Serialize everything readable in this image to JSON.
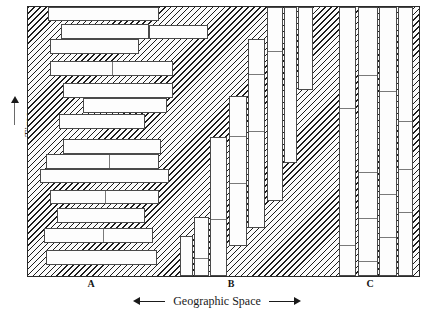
{
  "figure": {
    "type": "time-geography-settlement-diagram",
    "background_fill": "diagonal-hatch",
    "hatch_color": "#1d1d1d",
    "block_fill": "#fdfdfd",
    "block_stroke": "#4a4a4a",
    "frame_stroke": "#2a2a2a"
  },
  "axes": {
    "y": {
      "label": "Time",
      "arrow": "up",
      "direction_hint": "increasing upward"
    },
    "x": {
      "caption": "Geographic Space",
      "arrow_left": "◀",
      "arrow_right": "▶",
      "tick_labels": [
        "A",
        "B",
        "C"
      ]
    }
  },
  "regions": [
    {
      "id": "A",
      "label": "A",
      "label_x_pct": 16.2,
      "orientation": "horizontal-bars",
      "bar_count": 14
    },
    {
      "id": "B",
      "label": "B",
      "label_x_pct": 52.0,
      "orientation": "vertical-bars-ascending",
      "bar_count": 8
    },
    {
      "id": "C",
      "label": "C",
      "label_x_pct": 85.0,
      "orientation": "vertical-bars-tall",
      "bar_count": 4
    }
  ],
  "chart_data": {
    "type": "bar",
    "title": "",
    "xlabel": "Geographic Space",
    "ylabel": "Time",
    "xlim": [
      0,
      100
    ],
    "ylim": [
      0,
      100
    ],
    "grid": false,
    "legend": "none",
    "categories": [
      "A",
      "B",
      "C"
    ],
    "values": [
      14,
      8,
      4
    ],
    "blocks_A": [
      {
        "x": 5.0,
        "y": 0.0,
        "w": 28.5,
        "h": 5.2,
        "splits": []
      },
      {
        "x": 8.5,
        "y": 6.2,
        "w": 22.5,
        "h": 5.6,
        "splits": []
      },
      {
        "x": 31.0,
        "y": 6.8,
        "w": 15.0,
        "h": 5.0,
        "splits": []
      },
      {
        "x": 5.5,
        "y": 12.0,
        "w": 23.0,
        "h": 5.4,
        "splits": []
      },
      {
        "x": 5.5,
        "y": 20.0,
        "w": 31.5,
        "h": 5.6,
        "splits": [
          50.0
        ]
      },
      {
        "x": 9.0,
        "y": 28.2,
        "w": 28.0,
        "h": 5.6,
        "splits": []
      },
      {
        "x": 14.0,
        "y": 34.0,
        "w": 21.5,
        "h": 5.4,
        "splits": []
      },
      {
        "x": 8.0,
        "y": 39.6,
        "w": 22.0,
        "h": 5.6,
        "splits": []
      },
      {
        "x": 9.0,
        "y": 49.0,
        "w": 25.0,
        "h": 5.6,
        "splits": []
      },
      {
        "x": 4.5,
        "y": 54.8,
        "w": 29.0,
        "h": 5.6,
        "splits": [
          55.0
        ]
      },
      {
        "x": 3.0,
        "y": 60.4,
        "w": 33.0,
        "h": 5.2,
        "splits": []
      },
      {
        "x": 5.5,
        "y": 68.0,
        "w": 28.0,
        "h": 5.4,
        "splits": [
          50.0
        ]
      },
      {
        "x": 7.5,
        "y": 74.8,
        "w": 22.5,
        "h": 5.4,
        "splits": []
      },
      {
        "x": 4.0,
        "y": 82.0,
        "w": 28.0,
        "h": 5.6,
        "splits": [
          53.0
        ]
      },
      {
        "x": 4.5,
        "y": 90.4,
        "w": 28.5,
        "h": 5.6,
        "splits": []
      }
    ],
    "blocks_B": [
      {
        "x": 39.0,
        "y": 85.0,
        "w": 3.2,
        "h": 15.0,
        "splits": []
      },
      {
        "x": 42.5,
        "y": 78.0,
        "w": 3.8,
        "h": 22.0,
        "splits": [
          68.0
        ]
      },
      {
        "x": 46.5,
        "y": 48.5,
        "w": 4.5,
        "h": 51.5,
        "splits": [
          58.0
        ]
      },
      {
        "x": 51.5,
        "y": 33.0,
        "w": 4.5,
        "h": 56.0,
        "splits": [
          26.0,
          57.0
        ]
      },
      {
        "x": 56.2,
        "y": 12.0,
        "w": 4.5,
        "h": 70.0,
        "splits": [
          18.0,
          48.0
        ]
      },
      {
        "x": 61.0,
        "y": 0.0,
        "w": 4.2,
        "h": 72.0,
        "splits": [
          22.0
        ]
      },
      {
        "x": 65.5,
        "y": 0.0,
        "w": 3.2,
        "h": 58.0,
        "splits": []
      },
      {
        "x": 69.0,
        "y": 0.0,
        "w": 4.0,
        "h": 31.0,
        "splits": []
      }
    ],
    "blocks_C": [
      {
        "x": 79.5,
        "y": 0.0,
        "w": 4.5,
        "h": 100.0,
        "splits": [
          37.0,
          88.0
        ]
      },
      {
        "x": 84.5,
        "y": 0.0,
        "w": 5.0,
        "h": 100.0,
        "splits": [
          25.0,
          61.0,
          78.0,
          94.0
        ]
      },
      {
        "x": 89.8,
        "y": 0.0,
        "w": 4.5,
        "h": 100.0,
        "splits": [
          31.0,
          69.0,
          85.0
        ]
      },
      {
        "x": 94.5,
        "y": 0.0,
        "w": 4.0,
        "h": 100.0,
        "splits": [
          42.0,
          60.0,
          76.0
        ]
      }
    ]
  }
}
